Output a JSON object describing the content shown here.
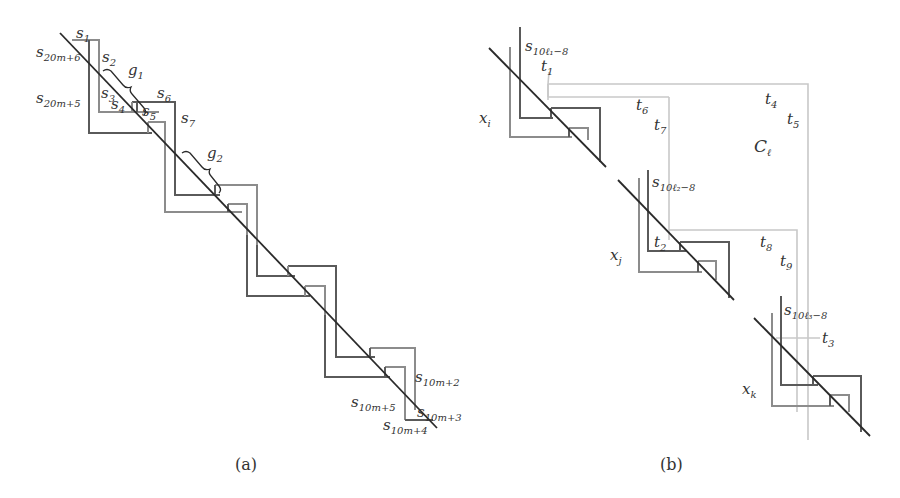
{
  "figure": {
    "panel_a": {
      "caption": "(a)",
      "labels": {
        "s1": {
          "base": "s",
          "sub": "1"
        },
        "s20m6": {
          "base": "s",
          "sub": "20m+6"
        },
        "s2": {
          "base": "s",
          "sub": "2"
        },
        "g1": {
          "base": "g",
          "sub": "1"
        },
        "s20m5": {
          "base": "s",
          "sub": "20m+5"
        },
        "s3": {
          "base": "s",
          "sub": "3"
        },
        "s4": {
          "base": "s",
          "sub": "4"
        },
        "s5": {
          "base": "s",
          "sub": "5"
        },
        "s6": {
          "base": "s",
          "sub": "6"
        },
        "s7": {
          "base": "s",
          "sub": "7"
        },
        "g2": {
          "base": "g",
          "sub": "2"
        },
        "s10m2": {
          "base": "s",
          "sub": "10m+2"
        },
        "s10m5": {
          "base": "s",
          "sub": "10m+5"
        },
        "s10m3": {
          "base": "s",
          "sub": "10m+3"
        },
        "s10m4": {
          "base": "s",
          "sub": "10m+4"
        }
      }
    },
    "panel_b": {
      "caption": "(b)",
      "labels": {
        "s10l1": {
          "base": "s",
          "sub": "10ℓ₁−8"
        },
        "t1": {
          "base": "t",
          "sub": "1"
        },
        "xi": {
          "base": "x",
          "sub": "i"
        },
        "t6": {
          "base": "t",
          "sub": "6"
        },
        "t7": {
          "base": "t",
          "sub": "7"
        },
        "t4": {
          "base": "t",
          "sub": "4"
        },
        "t5": {
          "base": "t",
          "sub": "5"
        },
        "Cl": {
          "base": "C",
          "sub": "ℓ"
        },
        "s10l2": {
          "base": "s",
          "sub": "10ℓ₂−8"
        },
        "t2": {
          "base": "t",
          "sub": "2"
        },
        "xj": {
          "base": "x",
          "sub": "j"
        },
        "t8": {
          "base": "t",
          "sub": "8"
        },
        "t9": {
          "base": "t",
          "sub": "9"
        },
        "s10l3": {
          "base": "s",
          "sub": "10ℓ₃−8"
        },
        "t3": {
          "base": "t",
          "sub": "3"
        },
        "xk": {
          "base": "x",
          "sub": "k"
        }
      }
    }
  }
}
